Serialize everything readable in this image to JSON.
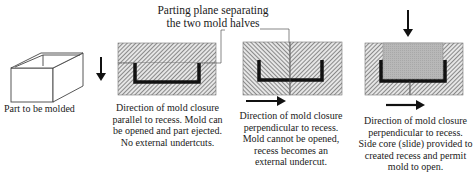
{
  "diagram": {
    "title_line1": "Parting plane separating",
    "title_line2": "the two mold halves",
    "panels": [
      {
        "id": "part",
        "caption": "Part to be molded"
      },
      {
        "id": "parallel",
        "caption_lines": [
          "Direction of mold closure",
          "parallel to recess.  Mold can",
          "be opened and part ejected.",
          "No external undertcuts."
        ],
        "arrow_direction": "down",
        "parting_plane": "horizontal"
      },
      {
        "id": "perpendicular",
        "caption_lines": [
          "Direction of mold closure",
          "perpendicular to recess.",
          "Mold cannot be opened,",
          "recess becomes an",
          "external undercut."
        ],
        "arrow_direction": "right",
        "parting_plane": "vertical"
      },
      {
        "id": "side-core",
        "caption_lines": [
          "Direction of mold closure",
          "perpendicular to recess.",
          "Side core (slide) provided to",
          "created recess and permit",
          "mold to open."
        ],
        "arrow_direction": "right",
        "core_arrow_direction": "down",
        "parting_plane": "vertical"
      }
    ],
    "colors": {
      "hatch": "#555555",
      "mold_fill": "#d9d9d9",
      "part_section": "#111111",
      "side_core": "#b5b5b5",
      "line": "#333333"
    }
  }
}
